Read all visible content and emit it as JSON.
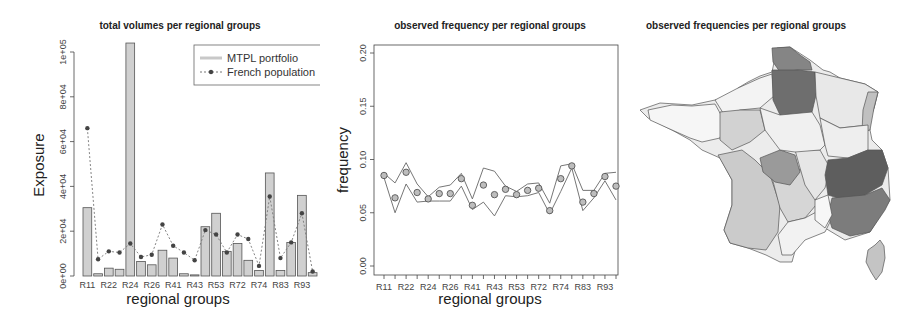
{
  "chart_data": [
    {
      "type": "bar",
      "title": "total volumes per regional groups",
      "xlabel": "regional groups",
      "ylabel": "Exposure",
      "ylim": [
        0,
        100000
      ],
      "yticks": [
        "0e+00",
        "2e+04",
        "4e+04",
        "6e+04",
        "8e+04",
        "1e+05"
      ],
      "categories": [
        "R11",
        "R21",
        "R22",
        "R23",
        "R24",
        "R25",
        "R26",
        "R31",
        "R41",
        "R42",
        "R43",
        "R52",
        "R53",
        "R54",
        "R72",
        "R73",
        "R74",
        "R82",
        "R83",
        "R91",
        "R93",
        "R94"
      ],
      "xtick_labels_shown": [
        "R11",
        "R22",
        "R24",
        "R26",
        "R41",
        "R43",
        "R53",
        "R72",
        "R74",
        "R83",
        "R93"
      ],
      "legend": {
        "position": "top-right",
        "entries": [
          "MTPL portfolio",
          "French population"
        ]
      },
      "series": [
        {
          "name": "MTPL portfolio",
          "style": "bar",
          "color": "#d0d0d0",
          "values": [
            30500,
            1000,
            3500,
            3000,
            104000,
            6500,
            5000,
            11500,
            8000,
            1000,
            500,
            22000,
            28000,
            11000,
            14500,
            7000,
            2500,
            46000,
            2500,
            15000,
            36000,
            1500
          ]
        },
        {
          "name": "French population",
          "style": "dotted-line-points",
          "color": "#555555",
          "values": [
            66000,
            7500,
            11000,
            10500,
            14500,
            8500,
            9500,
            23000,
            13500,
            10500,
            7000,
            20500,
            18500,
            10500,
            18500,
            16500,
            4500,
            35500,
            8000,
            15000,
            28000,
            2000
          ]
        }
      ]
    },
    {
      "type": "line",
      "title": "observed frequency per regional groups",
      "xlabel": "regional groups",
      "ylabel": "frequency",
      "ylim": [
        0,
        0.2
      ],
      "yticks": [
        "0.00",
        "0.05",
        "0.10",
        "0.15",
        "0.20"
      ],
      "categories": [
        "R11",
        "R21",
        "R22",
        "R23",
        "R24",
        "R25",
        "R26",
        "R31",
        "R41",
        "R42",
        "R43",
        "R52",
        "R53",
        "R54",
        "R72",
        "R73",
        "R74",
        "R82",
        "R83",
        "R91",
        "R93",
        "R94"
      ],
      "xtick_labels_shown": [
        "R11",
        "R22",
        "R24",
        "R26",
        "R41",
        "R43",
        "R53",
        "R72",
        "R74",
        "R83",
        "R93"
      ],
      "series": [
        {
          "name": "observed",
          "style": "points",
          "values": [
            0.085,
            0.064,
            0.088,
            0.069,
            0.063,
            0.068,
            0.068,
            0.082,
            0.057,
            0.076,
            0.067,
            0.072,
            0.067,
            0.071,
            0.073,
            0.052,
            0.082,
            0.094,
            0.06,
            0.068,
            0.084,
            0.075
          ]
        },
        {
          "name": "upper bound",
          "style": "line",
          "values": [
            0.087,
            0.078,
            0.097,
            0.077,
            0.065,
            0.074,
            0.076,
            0.087,
            0.063,
            0.092,
            0.089,
            0.075,
            0.07,
            0.077,
            0.078,
            0.059,
            0.094,
            0.096,
            0.071,
            0.071,
            0.087,
            0.088
          ]
        },
        {
          "name": "lower bound",
          "style": "line",
          "values": [
            0.083,
            0.05,
            0.077,
            0.06,
            0.061,
            0.061,
            0.061,
            0.075,
            0.053,
            0.06,
            0.047,
            0.066,
            0.065,
            0.066,
            0.069,
            0.049,
            0.07,
            0.092,
            0.052,
            0.064,
            0.08,
            0.062
          ]
        }
      ]
    },
    {
      "type": "heatmap",
      "subtype": "choropleth-map",
      "title": "observed frequencies per regional groups",
      "region": "France (departments)",
      "scale": "grayscale, darker = higher frequency",
      "highlights": [
        {
          "area": "north (Nord / Picardie / Ile-de-France)",
          "shade": "dark"
        },
        {
          "area": "south-east (Rhone-Alpes / PACA)",
          "shade": "dark"
        },
        {
          "area": "centre (Limousin)",
          "shade": "medium"
        },
        {
          "area": "south-west (Aquitaine / Midi-Pyrenees)",
          "shade": "light-medium"
        },
        {
          "area": "remaining regions",
          "shade": "light"
        }
      ]
    }
  ],
  "panels": {
    "left": {
      "title": "total volumes per regional groups",
      "xlabel": "regional groups",
      "ylabel": "Exposure",
      "legend": {
        "a": "MTPL portfolio",
        "b": "French population"
      }
    },
    "middle": {
      "title": "observed frequency per regional groups",
      "xlabel": "regional groups",
      "ylabel": "frequency"
    },
    "right": {
      "title": "observed frequencies per regional groups"
    }
  }
}
